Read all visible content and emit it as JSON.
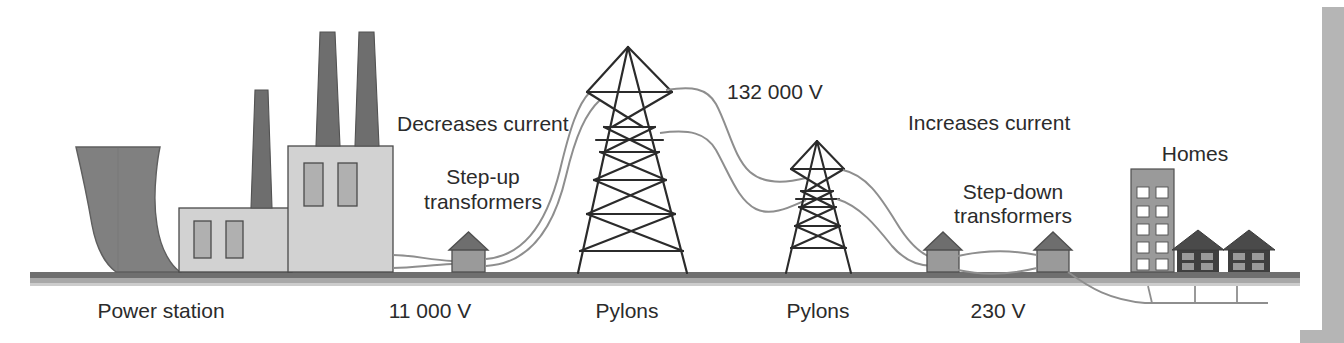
{
  "figure": {
    "background_color": "#ffffff"
  },
  "palette": {
    "dark_gray": "#808080",
    "darker_gray": "#6e6e6e",
    "light_gray": "#d2d2d2",
    "mid_gray": "#9a9a9a",
    "window_gray": "#b0b0b0",
    "ground_gray": "#8c8c8c",
    "outline": "#3a3a3a",
    "wire": "#8e8e8e",
    "text": "#2b2b2b",
    "border_gray": "#b5b5b5"
  },
  "labels": {
    "power_station": "Power station",
    "decreases_current": "Decreases current",
    "step_up_transformers_line1": "Step-up",
    "step_up_transformers_line2": "transformers",
    "voltage_11000": "11 000 V",
    "pylons_left": "Pylons",
    "voltage_132000": "132 000 V",
    "pylons_right": "Pylons",
    "increases_current": "Increases current",
    "step_down_transformers_line1": "Step-down",
    "step_down_transformers_line2": "transformers",
    "voltage_230": "230 V",
    "homes": "Homes"
  },
  "stages": [
    {
      "name": "power-station",
      "label": "Power station",
      "voltage": "11 000 V"
    },
    {
      "name": "step-up-transformers",
      "label": "Step-up transformers",
      "effect": "Decreases current"
    },
    {
      "name": "pylons-high-voltage",
      "label": "Pylons",
      "voltage": "132 000 V"
    },
    {
      "name": "step-down-transformers",
      "label": "Step-down transformers",
      "effect": "Increases current"
    },
    {
      "name": "homes",
      "label": "Homes",
      "voltage": "230 V"
    }
  ],
  "icons": {
    "cooling_tower": "cooling-tower-icon",
    "chimney": "chimney-icon",
    "pylon": "pylon-icon",
    "transformer": "transformer-icon",
    "apartment_block": "apartment-block-icon",
    "house": "house-icon",
    "power_line": "power-line-icon",
    "ground": "ground-line-icon"
  },
  "counts": {
    "chimneys": 3,
    "pylons": 2,
    "step_up_transformers": 1,
    "step_down_transformers": 2,
    "houses": 2,
    "apartment_blocks": 1,
    "apartment_window_rows": 5,
    "apartment_window_cols": 2
  }
}
